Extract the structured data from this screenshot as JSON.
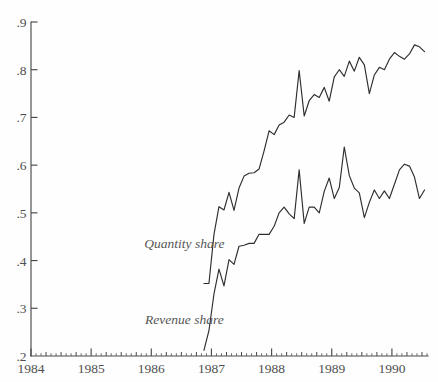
{
  "chart_data": {
    "type": "line",
    "title": "",
    "subtitle": "",
    "xlabel": "",
    "ylabel": "",
    "xlim": [
      1984.0,
      1990.6
    ],
    "ylim": [
      0.2,
      0.9
    ],
    "grid": false,
    "legend_position": "inline-annotation",
    "x_tick_labels": [
      "1984",
      "1985",
      "1986",
      "1987",
      "1988",
      "1989",
      "1990"
    ],
    "x_tick_values": [
      1984,
      1985,
      1986,
      1987,
      1988,
      1989,
      1990
    ],
    "x_minor_ticks_per_year": 12,
    "y_tick_labels": [
      ".2",
      ".3",
      ".4",
      ".5",
      ".6",
      ".7",
      ".8",
      ".9"
    ],
    "y_tick_values": [
      0.2,
      0.3,
      0.4,
      0.5,
      0.6,
      0.7,
      0.8,
      0.9
    ],
    "annotations": [
      {
        "text": "Quantity share",
        "x": 1986.55,
        "y": 0.427
      },
      {
        "text": "Revenue share",
        "x": 1986.55,
        "y": 0.268
      }
    ],
    "series": [
      {
        "name": "Quantity share",
        "x": [
          1986.875,
          1986.958,
          1987.042,
          1987.125,
          1987.208,
          1987.292,
          1987.375,
          1987.458,
          1987.542,
          1987.625,
          1987.708,
          1987.792,
          1987.875,
          1987.958,
          1988.042,
          1988.125,
          1988.208,
          1988.292,
          1988.375,
          1988.458,
          1988.542,
          1988.625,
          1988.708,
          1988.792,
          1988.875,
          1988.958,
          1989.042,
          1989.125,
          1989.208,
          1989.292,
          1989.375,
          1989.458,
          1989.542,
          1989.625,
          1989.708,
          1989.792,
          1989.875,
          1989.958,
          1990.042,
          1990.125,
          1990.208,
          1990.292,
          1990.375,
          1990.458,
          1990.542
        ],
        "y": [
          0.352,
          0.352,
          0.455,
          0.513,
          0.506,
          0.543,
          0.505,
          0.552,
          0.577,
          0.583,
          0.584,
          0.592,
          0.63,
          0.672,
          0.664,
          0.684,
          0.69,
          0.705,
          0.7,
          0.798,
          0.703,
          0.735,
          0.748,
          0.742,
          0.763,
          0.734,
          0.785,
          0.8,
          0.786,
          0.818,
          0.797,
          0.826,
          0.81,
          0.75,
          0.789,
          0.805,
          0.8,
          0.822,
          0.836,
          0.828,
          0.822,
          0.833,
          0.852,
          0.848,
          0.838
        ]
      },
      {
        "name": "Revenue share",
        "x": [
          1986.875,
          1986.958,
          1987.042,
          1987.125,
          1987.208,
          1987.292,
          1987.375,
          1987.458,
          1987.542,
          1987.625,
          1987.708,
          1987.792,
          1987.875,
          1987.958,
          1988.042,
          1988.125,
          1988.208,
          1988.292,
          1988.375,
          1988.458,
          1988.542,
          1988.625,
          1988.708,
          1988.792,
          1988.875,
          1988.958,
          1989.042,
          1989.125,
          1989.208,
          1989.292,
          1989.375,
          1989.458,
          1989.542,
          1989.625,
          1989.708,
          1989.792,
          1989.875,
          1989.958,
          1990.042,
          1990.125,
          1990.208,
          1990.292,
          1990.375,
          1990.458,
          1990.542
        ],
        "y": [
          0.212,
          0.253,
          0.33,
          0.382,
          0.347,
          0.402,
          0.392,
          0.43,
          0.432,
          0.436,
          0.436,
          0.455,
          0.455,
          0.455,
          0.472,
          0.5,
          0.512,
          0.498,
          0.488,
          0.59,
          0.478,
          0.512,
          0.512,
          0.5,
          0.545,
          0.573,
          0.53,
          0.553,
          0.638,
          0.578,
          0.552,
          0.542,
          0.49,
          0.522,
          0.548,
          0.53,
          0.546,
          0.53,
          0.56,
          0.59,
          0.602,
          0.598,
          0.575,
          0.53,
          0.548
        ]
      }
    ]
  }
}
